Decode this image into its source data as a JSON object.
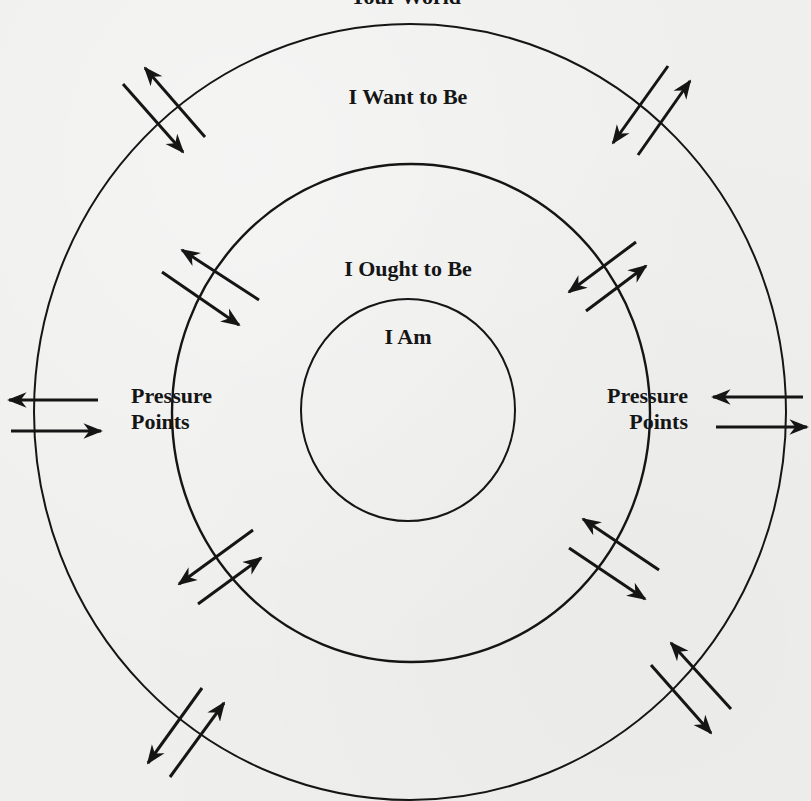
{
  "diagram": {
    "title": "Your World",
    "rings": [
      {
        "id": "outer",
        "label": "I Want to Be"
      },
      {
        "id": "middle",
        "label": "I Ought to Be"
      },
      {
        "id": "inner",
        "label": "I Am"
      }
    ],
    "pressure_points": {
      "left": {
        "line1": "Pressure",
        "line2": "Points"
      },
      "right": {
        "line1": "Pressure",
        "line2": "Points"
      }
    },
    "colors": {
      "background": "#efefee",
      "ink": "#151515"
    },
    "arrow_pairs": [
      {
        "position": "outer-top-left",
        "directions": [
          "outward",
          "inward"
        ]
      },
      {
        "position": "outer-top-right",
        "directions": [
          "inward",
          "outward"
        ]
      },
      {
        "position": "outer-left",
        "directions": [
          "outward",
          "inward"
        ]
      },
      {
        "position": "outer-right",
        "directions": [
          "inward",
          "outward"
        ]
      },
      {
        "position": "outer-bottom-left",
        "directions": [
          "outward",
          "inward"
        ]
      },
      {
        "position": "outer-bottom-right",
        "directions": [
          "inward",
          "outward"
        ]
      },
      {
        "position": "middle-top-left",
        "directions": [
          "outward",
          "inward"
        ]
      },
      {
        "position": "middle-top-right",
        "directions": [
          "inward",
          "outward"
        ]
      },
      {
        "position": "middle-bottom-left",
        "directions": [
          "outward",
          "inward"
        ]
      },
      {
        "position": "middle-bottom-right",
        "directions": [
          "inward",
          "outward"
        ]
      }
    ]
  }
}
